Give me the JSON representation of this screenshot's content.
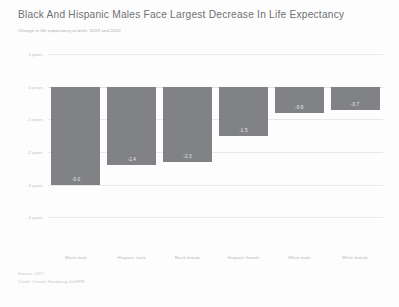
{
  "header": {
    "title": "Black And Hispanic Males Face Largest Decrease In Life Expectancy",
    "subtitle": "Change in life expectancy at birth, 2019 and 2020"
  },
  "footer": {
    "source": "Source: CDC",
    "credit": "Credit: Connie Hanzhang Jin/NPR"
  },
  "colors": {
    "bar": "#818285",
    "title": "#6e7073",
    "subtitle": "#a9abae",
    "axis_label": "#b6b8bb",
    "gridline": "#e8e8e8",
    "value_label": "#e9eaeb",
    "background": "#fdfdfd"
  },
  "chart_data": {
    "type": "bar",
    "title": "Black And Hispanic Males Face Largest Decrease In Life Expectancy",
    "subtitle": "Change in life expectancy at birth, 2019 and 2020",
    "xlabel": "",
    "ylabel": "",
    "categories": [
      "Black male",
      "Hispanic male",
      "Black female",
      "Hispanic female",
      "White male",
      "White female"
    ],
    "values": [
      -3.0,
      -2.4,
      -2.3,
      -1.5,
      -0.8,
      -0.7
    ],
    "value_labels": [
      "-3.0",
      "-2.4",
      "-2.3",
      "-1.5",
      "-0.8",
      "-0.7"
    ],
    "ylim": [
      -5,
      1
    ],
    "yticks": [
      1,
      0,
      -1,
      -2,
      -3,
      -4
    ],
    "ytick_labels": [
      "1 years",
      "0 years",
      "-1 years",
      "-2 years",
      "-3 years",
      "-4 years"
    ],
    "grid": true,
    "legend": false,
    "orientation": "vertical",
    "bar_color": "#818285"
  }
}
